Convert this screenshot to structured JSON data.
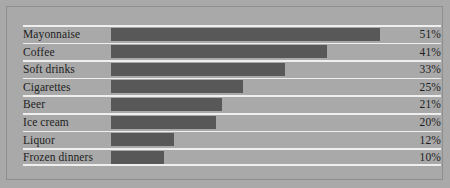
{
  "chart_data": {
    "type": "bar",
    "orientation": "horizontal",
    "title": "",
    "xlabel": "",
    "ylabel": "",
    "categories": [
      "Mayonnaise",
      "Coffee",
      "Soft drinks",
      "Cigarettes",
      "Beer",
      "Ice cream",
      "Liquor",
      "Frozen dinners"
    ],
    "values": [
      51,
      41,
      33,
      25,
      21,
      20,
      12,
      10
    ],
    "value_labels": [
      "51%",
      "41%",
      "33%",
      "25%",
      "21%",
      "20%",
      "12%",
      "10%"
    ],
    "xlim": [
      0,
      55
    ],
    "grid": false,
    "legend": false,
    "rows": [
      {
        "label": "Mayonnaise",
        "value": 51,
        "value_label": "51%"
      },
      {
        "label": "Coffee",
        "value": 41,
        "value_label": "41%"
      },
      {
        "label": "Soft drinks",
        "value": 33,
        "value_label": "33%"
      },
      {
        "label": "Cigarettes",
        "value": 25,
        "value_label": "25%"
      },
      {
        "label": "Beer",
        "value": 21,
        "value_label": "21%"
      },
      {
        "label": "Ice cream",
        "value": 20,
        "value_label": "20%"
      },
      {
        "label": "Liquor",
        "value": 12,
        "value_label": "12%"
      },
      {
        "label": "Frozen dinners",
        "value": 10,
        "value_label": "10%"
      }
    ]
  },
  "colors": {
    "background": "#a9a9a9",
    "bar": "#585858",
    "rule": "#efefef",
    "frame_border": "#8e8e8e",
    "text": "#1d1d1d"
  }
}
